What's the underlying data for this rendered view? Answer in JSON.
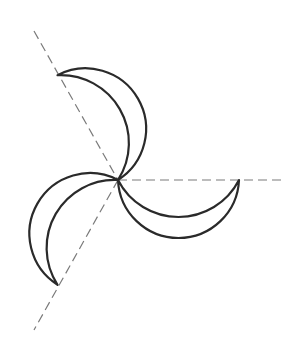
{
  "diagram": {
    "type": "three-blade propeller construction",
    "stroke_color": "#2a2a2a",
    "axis_color": "#7a7a7a",
    "center": [
      118,
      180
    ],
    "blade_count": 3,
    "blade_length": 121,
    "blade_angles_deg": [
      0,
      120,
      240
    ],
    "inner_arc_sag": 37,
    "outer_arc_sag": 58,
    "axes": [
      {
        "from": [
          118,
          180
        ],
        "to": [
          285,
          180
        ]
      },
      {
        "from": [
          34,
          31
        ],
        "to": [
          118,
          180
        ]
      },
      {
        "from": [
          118,
          180
        ],
        "to": [
          34,
          330
        ]
      }
    ]
  }
}
